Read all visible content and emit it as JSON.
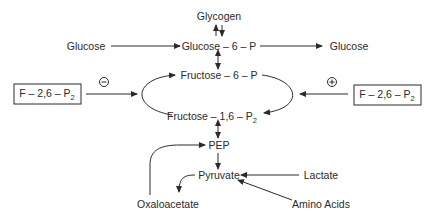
{
  "diagram": {
    "nodes": {
      "glycogen": "Glycogen",
      "glucose_in": "Glucose",
      "glucose_6_p": "Glucose – 6 – P",
      "glucose_out": "Glucose",
      "fructose_6_p": "Fructose – 6 – P",
      "fructose_1_6_p2_main": "Fructose – 1,6 – P",
      "fructose_1_6_p2_sub": "2",
      "pep": "PEP",
      "pyruvate": "Pyruvate",
      "lactate": "Lactate",
      "amino_acids": "Amino Acids",
      "oxaloacetate": "Oxaloacetate"
    },
    "regulators": {
      "left": {
        "main": "F – 2,6 – P",
        "sub": "2",
        "sign": "−",
        "effect": "inhibition"
      },
      "right": {
        "main": "F – 2,6 – P",
        "sub": "2",
        "sign": "+",
        "effect": "activation"
      }
    },
    "colors": {
      "ink": "#2a2a2a",
      "background": "#ffffff"
    }
  }
}
